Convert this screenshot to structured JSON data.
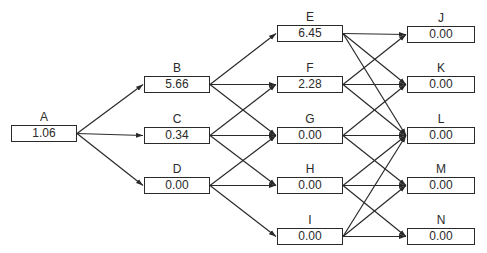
{
  "diagram": {
    "type": "layered-network",
    "colors": {
      "line": "#2a2a2a",
      "text": "#2a2a2a",
      "background": "#ffffff"
    },
    "nodes": [
      {
        "id": "A",
        "label": "A",
        "value": "1.06",
        "x": 11,
        "y": 125,
        "w": 66,
        "h": 17
      },
      {
        "id": "B",
        "label": "B",
        "value": "5.66",
        "x": 144,
        "y": 76,
        "w": 66,
        "h": 17
      },
      {
        "id": "C",
        "label": "C",
        "value": "0.34",
        "x": 144,
        "y": 127,
        "w": 66,
        "h": 17
      },
      {
        "id": "D",
        "label": "D",
        "value": "0.00",
        "x": 144,
        "y": 177,
        "w": 66,
        "h": 17
      },
      {
        "id": "E",
        "label": "E",
        "value": "6.45",
        "x": 277,
        "y": 25,
        "w": 66,
        "h": 17
      },
      {
        "id": "F",
        "label": "F",
        "value": "2.28",
        "x": 277,
        "y": 76,
        "w": 66,
        "h": 17
      },
      {
        "id": "G",
        "label": "G",
        "value": "0.00",
        "x": 277,
        "y": 127,
        "w": 66,
        "h": 17
      },
      {
        "id": "H",
        "label": "H",
        "value": "0.00",
        "x": 277,
        "y": 177,
        "w": 66,
        "h": 17
      },
      {
        "id": "I",
        "label": "I",
        "value": "0.00",
        "x": 277,
        "y": 228,
        "w": 66,
        "h": 17
      },
      {
        "id": "J",
        "label": "J",
        "value": "0.00",
        "x": 407,
        "y": 26,
        "w": 68,
        "h": 17
      },
      {
        "id": "K",
        "label": "K",
        "value": "0.00",
        "x": 407,
        "y": 76,
        "w": 68,
        "h": 17
      },
      {
        "id": "L",
        "label": "L",
        "value": "0.00",
        "x": 407,
        "y": 127,
        "w": 68,
        "h": 17
      },
      {
        "id": "M",
        "label": "M",
        "value": "0.00",
        "x": 407,
        "y": 177,
        "w": 68,
        "h": 17
      },
      {
        "id": "N",
        "label": "N",
        "value": "0.00",
        "x": 407,
        "y": 228,
        "w": 68,
        "h": 17
      }
    ],
    "edges": [
      [
        "A",
        "B"
      ],
      [
        "A",
        "C"
      ],
      [
        "A",
        "D"
      ],
      [
        "B",
        "E"
      ],
      [
        "B",
        "F"
      ],
      [
        "B",
        "G"
      ],
      [
        "C",
        "F"
      ],
      [
        "C",
        "G"
      ],
      [
        "C",
        "H"
      ],
      [
        "D",
        "G"
      ],
      [
        "D",
        "H"
      ],
      [
        "D",
        "I"
      ],
      [
        "E",
        "J"
      ],
      [
        "E",
        "K"
      ],
      [
        "E",
        "L"
      ],
      [
        "F",
        "J"
      ],
      [
        "F",
        "K"
      ],
      [
        "F",
        "L"
      ],
      [
        "G",
        "K"
      ],
      [
        "G",
        "L"
      ],
      [
        "G",
        "M"
      ],
      [
        "H",
        "L"
      ],
      [
        "H",
        "M"
      ],
      [
        "H",
        "N"
      ],
      [
        "I",
        "L"
      ],
      [
        "I",
        "M"
      ],
      [
        "I",
        "N"
      ]
    ]
  }
}
